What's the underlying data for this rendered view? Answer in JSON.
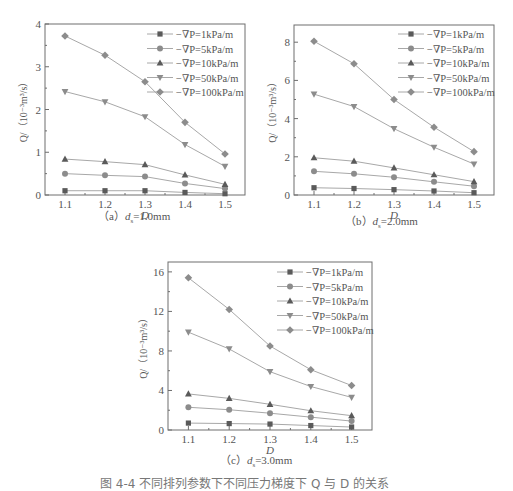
{
  "chart_data": [
    {
      "id": "a",
      "type": "line",
      "title": "",
      "subcaption": "（a）ds=1.0mm",
      "subcaption_prefix": "（a）",
      "subcaption_var": "d",
      "subcaption_sub": "s",
      "subcaption_value": "=1.0mm",
      "xlabel": "D",
      "ylabel": "Q/（10⁻³m³/s）",
      "x": [
        1.1,
        1.2,
        1.3,
        1.4,
        1.5
      ],
      "x_ticks": [
        "1.1",
        "1.2",
        "1.3",
        "1.4",
        "1.5"
      ],
      "y_ticks": [
        "0",
        "1",
        "2",
        "3",
        "4"
      ],
      "ylim": [
        0,
        4
      ],
      "xlim": [
        1.05,
        1.55
      ],
      "legend_position": "upper right",
      "grid": false,
      "series": [
        {
          "name": "−∇P=1kPa/m",
          "marker": "square",
          "values": [
            0.1,
            0.1,
            0.1,
            0.06,
            0.03
          ]
        },
        {
          "name": "−∇P=5kPa/m",
          "marker": "circle",
          "values": [
            0.5,
            0.46,
            0.43,
            0.27,
            0.15
          ]
        },
        {
          "name": "−∇P=10kPa/m",
          "marker": "triangle-up",
          "values": [
            0.84,
            0.78,
            0.71,
            0.47,
            0.25
          ]
        },
        {
          "name": "−∇P=50kPa/m",
          "marker": "triangle-down",
          "values": [
            2.42,
            2.18,
            1.83,
            1.18,
            0.67
          ]
        },
        {
          "name": "−∇P=100kPa/m",
          "marker": "diamond",
          "values": [
            3.72,
            3.27,
            2.65,
            1.7,
            0.96
          ]
        }
      ]
    },
    {
      "id": "b",
      "type": "line",
      "title": "",
      "subcaption": "（b）ds=2.0mm",
      "subcaption_prefix": "（b）",
      "subcaption_var": "d",
      "subcaption_sub": "s",
      "subcaption_value": "=2.0mm",
      "xlabel": "D",
      "ylabel": "Q/（10⁻³m³/s）",
      "x": [
        1.1,
        1.2,
        1.3,
        1.4,
        1.5
      ],
      "x_ticks": [
        "1.1",
        "1.2",
        "1.3",
        "1.4",
        "1.5"
      ],
      "y_ticks": [
        "0",
        "2",
        "4",
        "6",
        "8"
      ],
      "ylim": [
        0,
        8
      ],
      "xlim": [
        1.05,
        1.55
      ],
      "legend_position": "upper right",
      "grid": false,
      "series": [
        {
          "name": "−∇P=1kPa/m",
          "marker": "square",
          "values": [
            0.38,
            0.34,
            0.28,
            0.21,
            0.12
          ]
        },
        {
          "name": "−∇P=5kPa/m",
          "marker": "circle",
          "values": [
            1.24,
            1.11,
            0.93,
            0.69,
            0.46
          ]
        },
        {
          "name": "−∇P=10kPa/m",
          "marker": "triangle-up",
          "values": [
            1.95,
            1.77,
            1.42,
            1.06,
            0.7
          ]
        },
        {
          "name": "−∇P=50kPa/m",
          "marker": "triangle-down",
          "values": [
            5.28,
            4.63,
            3.47,
            2.5,
            1.62
          ]
        },
        {
          "name": "−∇P=100kPa/m",
          "marker": "diamond",
          "values": [
            8.05,
            6.87,
            5.0,
            3.55,
            2.27
          ]
        }
      ]
    },
    {
      "id": "c",
      "type": "line",
      "title": "",
      "subcaption": "（c）ds=3.0mm",
      "subcaption_prefix": "（c）",
      "subcaption_var": "d",
      "subcaption_sub": "s",
      "subcaption_value": "=3.0mm",
      "xlabel": "D",
      "ylabel": "Q/（10⁻³m³/s）",
      "x": [
        1.1,
        1.2,
        1.3,
        1.4,
        1.5
      ],
      "x_ticks": [
        "1.1",
        "1.2",
        "1.3",
        "1.4",
        "1.5"
      ],
      "y_ticks": [
        "0",
        "4",
        "8",
        "12",
        "16"
      ],
      "ylim": [
        0,
        17
      ],
      "xlim": [
        1.05,
        1.55
      ],
      "legend_position": "upper right",
      "grid": false,
      "series": [
        {
          "name": "−∇P=1kPa/m",
          "marker": "square",
          "values": [
            0.7,
            0.65,
            0.6,
            0.45,
            0.3
          ]
        },
        {
          "name": "−∇P=5kPa/m",
          "marker": "circle",
          "values": [
            2.3,
            2.05,
            1.7,
            1.3,
            0.9
          ]
        },
        {
          "name": "−∇P=10kPa/m",
          "marker": "triangle-up",
          "values": [
            3.65,
            3.2,
            2.6,
            1.95,
            1.45
          ]
        },
        {
          "name": "−∇P=50kPa/m",
          "marker": "triangle-down",
          "values": [
            9.9,
            8.2,
            5.9,
            4.4,
            3.3
          ]
        },
        {
          "name": "−∇P=100kPa/m",
          "marker": "diamond",
          "values": [
            15.4,
            12.2,
            8.5,
            6.1,
            4.5
          ]
        }
      ]
    }
  ],
  "colors": {
    "line": "#a8a8a8",
    "marker_dark": "#5a5a5a",
    "marker_light": "#8c8c8c",
    "frame": "#6e6e6e",
    "text": "#555555"
  },
  "figure_caption": "图 4-4  不同排列参数下不同压力梯度下 Q 与 D 的关系"
}
